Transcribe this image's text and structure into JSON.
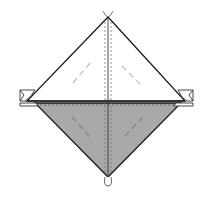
{
  "diagram": {
    "type": "origami-fold-diagram",
    "colors": {
      "background": "#ffffff",
      "outline": "#1a1a1a",
      "paper_front": "#ffffff",
      "paper_back": "#a9a9a9",
      "valley_fold_line": "#bdbdbd",
      "crease_dashed": "#555555"
    },
    "elements": [
      {
        "name": "upper-triangle",
        "fill": "white"
      },
      {
        "name": "lower-triangle",
        "fill": "gray"
      },
      {
        "name": "center-crease",
        "style": "dashed"
      },
      {
        "name": "horizontal-crease",
        "style": "dashed"
      },
      {
        "name": "fold-guide-lines",
        "count": 4,
        "style": "dashed"
      },
      {
        "name": "left-tab",
        "shape": "folded-flap"
      },
      {
        "name": "right-tab",
        "shape": "folded-flap"
      },
      {
        "name": "top-marker",
        "shape": "open-curves"
      },
      {
        "name": "bottom-marker",
        "shape": "loop"
      }
    ]
  }
}
